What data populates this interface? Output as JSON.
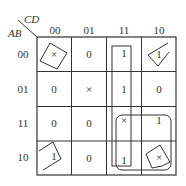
{
  "kmap": {
    "row_var": "AB",
    "col_var": "CD",
    "col_labels": [
      "00",
      "01",
      "11",
      "10"
    ],
    "row_labels": [
      "00",
      "01",
      "11",
      "10"
    ],
    "cells": [
      [
        "×",
        "0",
        "1",
        "1"
      ],
      [
        "0",
        "×",
        "1",
        "0"
      ],
      [
        "0",
        "0",
        "×",
        "1"
      ],
      [
        "1",
        "0",
        "1",
        "×"
      ]
    ],
    "groups": [
      {
        "name": "column-11-group",
        "cells": [
          "00-11",
          "01-11",
          "11-11",
          "10-11"
        ]
      },
      {
        "name": "bottom-right-quad-group",
        "cells": [
          "11-11",
          "11-10",
          "10-11",
          "10-10"
        ]
      },
      {
        "name": "corners-group",
        "cells": [
          "00-00",
          "00-10",
          "10-00",
          "10-10"
        ]
      }
    ]
  }
}
